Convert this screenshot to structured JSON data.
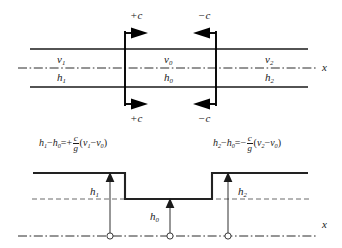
{
  "figure": {
    "title_hidden": "",
    "upper_diagram": {
      "name": "channel-plan-view",
      "wave_labels": {
        "top_left": "+c",
        "top_right": "−c",
        "bottom_left": "+c",
        "bottom_right": "−c"
      },
      "regions": [
        {
          "velocity": "v",
          "velocity_sub": "1",
          "depth": "h",
          "depth_sub": "1"
        },
        {
          "velocity": "v",
          "velocity_sub": "0",
          "depth": "h",
          "depth_sub": "0"
        },
        {
          "velocity": "v",
          "velocity_sub": "2",
          "depth": "h",
          "depth_sub": "2"
        }
      ],
      "axis_label": "x"
    },
    "equations": {
      "left": {
        "lhs_h": "h",
        "lhs_h_sub": "1",
        "minus": "−",
        "lhs_h0": "h",
        "lhs_h0_sub": "0",
        "eq": "=",
        "sign": "+",
        "num": "c",
        "den": "g",
        "paren_open": "(",
        "v_a": "v",
        "v_a_sub": "1",
        "inner_minus": "−",
        "v_b": "v",
        "v_b_sub": "0",
        "paren_close": ")"
      },
      "right": {
        "lhs_h": "h",
        "lhs_h_sub": "2",
        "minus": "−",
        "lhs_h0": "h",
        "lhs_h0_sub": "0",
        "eq": "=",
        "sign": "−",
        "num": "c",
        "den": "g",
        "paren_open": "(",
        "v_a": "v",
        "v_a_sub": "2",
        "inner_minus": "−",
        "v_b": "v",
        "v_b_sub": "0",
        "paren_close": ")"
      }
    },
    "lower_diagram": {
      "name": "water-surface-profile",
      "depth_labels": [
        {
          "base": "h",
          "sub": "1"
        },
        {
          "base": "h",
          "sub": "0"
        },
        {
          "base": "h",
          "sub": "2"
        }
      ],
      "axis_label": "x",
      "marker_count": 3
    },
    "colors": {
      "line": "#1a1a1a",
      "thick_line": "#000000",
      "background": "#ffffff",
      "dash_line": "#4a4a4a"
    }
  }
}
